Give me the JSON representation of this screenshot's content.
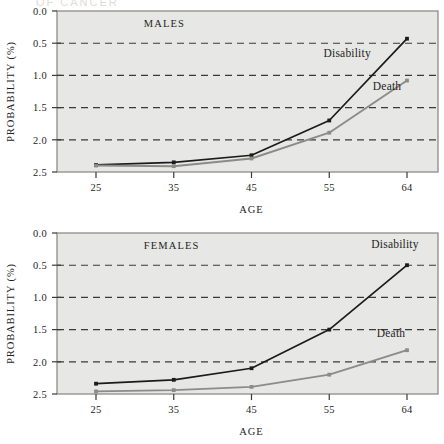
{
  "figure": {
    "background_color": "#ffffff",
    "plot_background_color": "#e7e7e5",
    "frame_color": "#8d8d8a",
    "grid_color": "#3a3a38",
    "text_color": "#231f1c"
  },
  "axis": {
    "ylabel": "PROBABILITY (%)",
    "xlabel": "AGE",
    "yticks": [
      "2.5",
      "2.0",
      "1.5",
      "1.0",
      "0.5",
      "0.0"
    ],
    "xticks": [
      "25",
      "35",
      "45",
      "55",
      "64"
    ]
  },
  "series_colors": {
    "disability": "#1b1b1b",
    "death": "#8b8b88"
  },
  "panels": [
    {
      "id": "males",
      "title": "MALES"
    },
    {
      "id": "females",
      "title": "FEMALES"
    }
  ],
  "labels": {
    "disability": "Disability",
    "death": "Death"
  },
  "chart_data": [
    {
      "type": "line",
      "title": "MALES",
      "xlabel": "AGE",
      "ylabel": "PROBABILITY (%)",
      "categories": [
        25,
        35,
        45,
        55,
        64
      ],
      "xlim": [
        25,
        64
      ],
      "ylim": [
        0.0,
        2.5
      ],
      "yticks": [
        0.0,
        0.5,
        1.0,
        1.5,
        2.0,
        2.5
      ],
      "grid": "horizontal-dashed",
      "legend": "inline-annotations",
      "series": [
        {
          "name": "Disability",
          "color": "#1b1b1b",
          "values": [
            0.11,
            0.15,
            0.26,
            0.8,
            2.07
          ]
        },
        {
          "name": "Death",
          "color": "#8b8b88",
          "values": [
            0.1,
            0.09,
            0.21,
            0.61,
            1.42
          ]
        }
      ],
      "annotations": [
        {
          "text": "MALES",
          "x": 31,
          "y": 2.25
        },
        {
          "text": "Disability",
          "x": 56.5,
          "y": 1.78
        },
        {
          "text": "Death",
          "x": 61.5,
          "y": 1.27
        }
      ]
    },
    {
      "type": "line",
      "title": "FEMALES",
      "xlabel": "AGE",
      "ylabel": "PROBABILITY (%)",
      "categories": [
        25,
        35,
        45,
        55,
        64
      ],
      "xlim": [
        25,
        64
      ],
      "ylim": [
        0.0,
        2.5
      ],
      "yticks": [
        0.0,
        0.5,
        1.0,
        1.5,
        2.0,
        2.5
      ],
      "grid": "horizontal-dashed",
      "legend": "inline-annotations",
      "series": [
        {
          "name": "Disability",
          "color": "#1b1b1b",
          "values": [
            0.16,
            0.22,
            0.4,
            1.0,
            2.0
          ]
        },
        {
          "name": "Death",
          "color": "#8b8b88",
          "values": [
            0.04,
            0.06,
            0.11,
            0.3,
            0.68
          ]
        }
      ],
      "annotations": [
        {
          "text": "FEMALES",
          "x": 31,
          "y": 2.25
        },
        {
          "text": "Disability",
          "x": 62.5,
          "y": 2.26
        },
        {
          "text": "Death",
          "x": 62.0,
          "y": 0.88
        }
      ]
    }
  ]
}
